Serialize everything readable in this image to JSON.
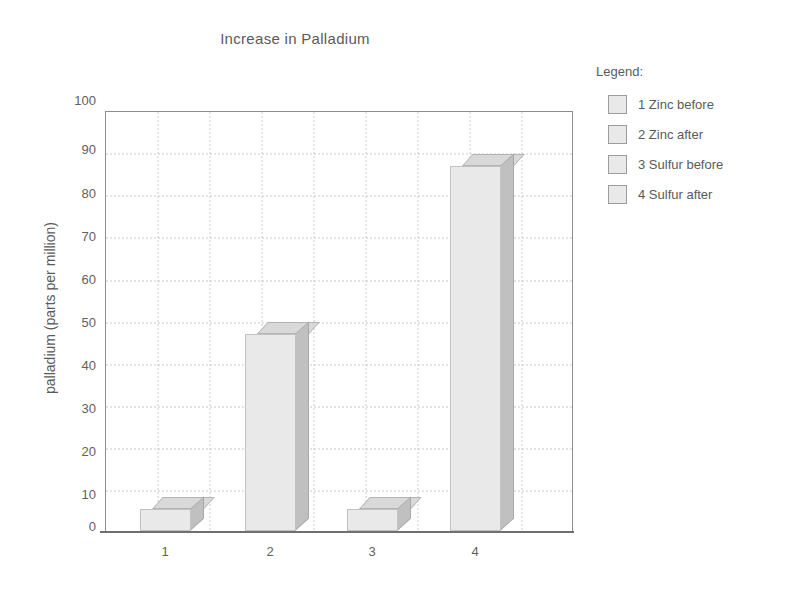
{
  "chart_data": {
    "type": "bar",
    "title": "Increase in Palladium",
    "xlabel": "",
    "ylabel": "palladium (parts per million)",
    "categories": [
      "1",
      "2",
      "3",
      "4"
    ],
    "values": [
      0,
      47,
      0,
      87
    ],
    "ylim": [
      0,
      100
    ],
    "yticks": [
      0,
      10,
      20,
      30,
      40,
      50,
      60,
      70,
      80,
      90,
      100
    ],
    "grid": true,
    "legend_position": "right",
    "legend_title": "Legend:",
    "legend_entries": [
      "1 Zinc before",
      "2 Zinc after",
      "3 Sulfur before",
      "4 Sulfur after"
    ],
    "style": "3d-bars",
    "colors": {
      "bar_front": "#e9e9e9",
      "bar_side": "#c0c0c0",
      "bar_top": "#d9d9d9",
      "grid": "#c9c9c9",
      "axis": "#6f6f6f",
      "text": "#5a5a5a"
    }
  }
}
